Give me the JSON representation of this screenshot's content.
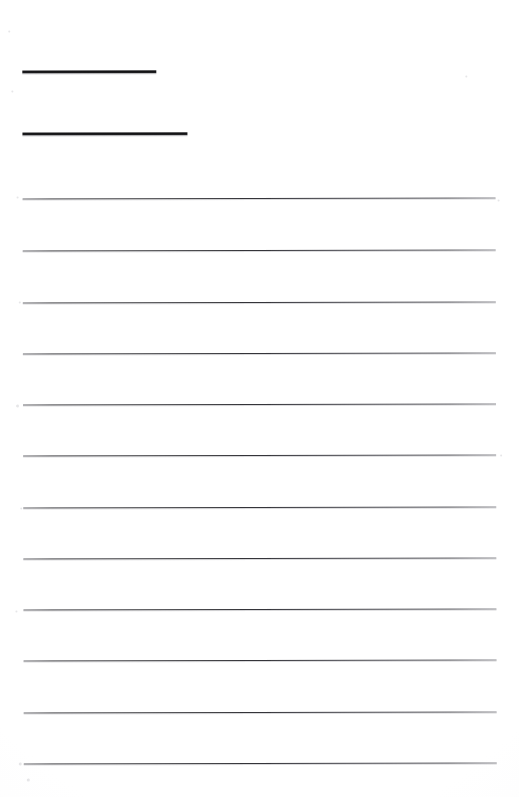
{
  "document": {
    "kind": "scanned-blank-ruled-form",
    "page_width": 519,
    "page_height": 797,
    "background_color": "#fefefe",
    "ink_color": "#303034",
    "header_ink_color": "#131315",
    "has_visible_text": false,
    "notes": ""
  },
  "header_rules": [
    {
      "name": "header-rule-1",
      "x": 23,
      "y": 70,
      "width": 134,
      "thickness": 2.5,
      "value": ""
    },
    {
      "name": "header-rule-2",
      "x": 23,
      "y": 132,
      "width": 165,
      "thickness": 2.5,
      "value": ""
    }
  ],
  "rule_lines": {
    "count": 12,
    "left": 23,
    "right": 496,
    "width": 473,
    "thickness": 1,
    "spacing": 51.4,
    "y_positions": [
      198,
      250,
      302,
      353,
      404,
      455,
      507,
      558,
      609,
      660,
      712,
      763
    ],
    "values": [
      "",
      "",
      "",
      "",
      "",
      "",
      "",
      "",
      "",
      "",
      "",
      ""
    ]
  },
  "speckles": [
    {
      "x": 17,
      "y": 196,
      "size": 2
    },
    {
      "x": 19,
      "y": 301,
      "size": 2
    },
    {
      "x": 16,
      "y": 404,
      "size": 3
    },
    {
      "x": 20,
      "y": 507,
      "size": 2
    },
    {
      "x": 15,
      "y": 610,
      "size": 2
    },
    {
      "x": 18,
      "y": 762,
      "size": 3
    },
    {
      "x": 9,
      "y": 30,
      "size": 2
    },
    {
      "x": 12,
      "y": 90,
      "size": 2
    },
    {
      "x": 466,
      "y": 76,
      "size": 2
    },
    {
      "x": 498,
      "y": 200,
      "size": 2
    },
    {
      "x": 500,
      "y": 455,
      "size": 2
    },
    {
      "x": 26,
      "y": 778,
      "size": 3
    }
  ]
}
